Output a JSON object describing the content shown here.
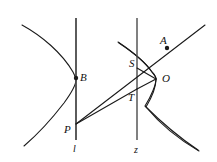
{
  "figure": {
    "type": "geometry-diagram",
    "stroke_color": "#1a1a1a",
    "background_color": "#ffffff",
    "width": 217,
    "height": 162,
    "labels": {
      "A": "A",
      "B": "B",
      "O": "O",
      "P": "P",
      "S": "S",
      "T": "T",
      "line_l": "l",
      "line_z": "z"
    },
    "points": [
      {
        "name": "A",
        "label": "A",
        "x": 167,
        "y": 48,
        "dot": true
      },
      {
        "name": "B",
        "label": "B",
        "x": 76,
        "y": 78,
        "dot": true
      },
      {
        "name": "O",
        "label": "O",
        "x": 156,
        "y": 78,
        "dot": false
      },
      {
        "name": "P",
        "label": "P",
        "x": 76,
        "y": 124,
        "dot": false
      },
      {
        "name": "S",
        "label": "S",
        "x": 137,
        "y": 68,
        "dot": false
      },
      {
        "name": "T",
        "label": "T",
        "x": 137,
        "y": 89,
        "dot": false
      }
    ],
    "vertical_lines": [
      {
        "name": "l",
        "label": "l",
        "x": 76,
        "y_top": 18,
        "y_bottom": 140
      },
      {
        "name": "z",
        "label": "z",
        "x": 137,
        "y_top": 18,
        "y_bottom": 140
      }
    ]
  }
}
